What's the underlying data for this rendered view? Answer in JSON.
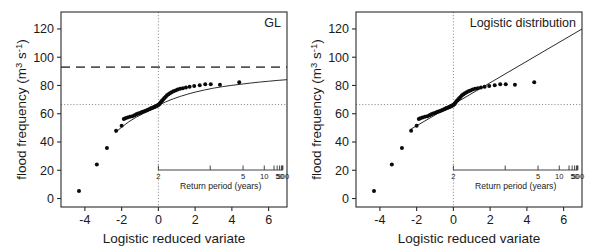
{
  "figure": {
    "axis_titles": {
      "x": "Logistic reduced variate",
      "y_main": "flood frequency (m",
      "y_sup1": "3",
      "y_mid": " s",
      "y_sup2": "-1",
      "y_close": ")",
      "y_full": "flood frequency (m3 s-1)",
      "inset_x": "Return period (years)"
    },
    "panels": [
      {
        "id": "left",
        "title": "GL"
      },
      {
        "id": "right",
        "title": "Logistic distribution"
      }
    ]
  },
  "chart_data": [
    {
      "type": "scatter",
      "title": "GL",
      "xlabel": "Logistic reduced variate",
      "ylabel": "flood frequency (m3 s-1)",
      "xlim": [
        -5.3,
        7.0
      ],
      "ylim": [
        -6,
        132
      ],
      "xticks": [
        -4,
        -2,
        0,
        2,
        4,
        6
      ],
      "xtick_labels": [
        "-4",
        "-2",
        "0",
        "2",
        "4",
        "6"
      ],
      "yticks": [
        0,
        20,
        40,
        60,
        80,
        100,
        120
      ],
      "ytick_labels": [
        "0",
        "20",
        "40",
        "60",
        "80",
        "100",
        "120"
      ],
      "grid": false,
      "legend": "none",
      "reference_lines": [
        {
          "name": "design-flood-dashed",
          "orientation": "horizontal",
          "y": 93,
          "style": "dashed"
        },
        {
          "name": "median-dotted",
          "orientation": "horizontal",
          "y": 66.5,
          "style": "dotted"
        },
        {
          "name": "zero-variate-dotted",
          "orientation": "vertical",
          "x": 0,
          "style": "dotted"
        }
      ],
      "inset_axis": {
        "name": "return-period-axis",
        "label": "Return period (years)",
        "labeled_ticks": [
          {
            "value": 2,
            "label": "2"
          },
          {
            "value": 5,
            "label": "5"
          },
          {
            "value": 10,
            "label": "10"
          },
          {
            "value": 50,
            "label": "50"
          },
          {
            "value": 500,
            "label": "500"
          }
        ],
        "unlabeled_ticks": [
          3,
          20,
          30,
          100,
          200
        ]
      },
      "points": [
        [
          -4.32,
          5.3
        ],
        [
          -3.35,
          24.0
        ],
        [
          -2.8,
          35.8
        ],
        [
          -2.3,
          47.9
        ],
        [
          -2.0,
          51.5
        ],
        [
          -1.88,
          56.2
        ],
        [
          -1.8,
          56.8
        ],
        [
          -1.68,
          57.4
        ],
        [
          -1.55,
          57.8
        ],
        [
          -1.42,
          58.3
        ],
        [
          -1.3,
          58.9
        ],
        [
          -1.2,
          59.6
        ],
        [
          -1.1,
          60.2
        ],
        [
          -1.0,
          60.6
        ],
        [
          -0.92,
          61.0
        ],
        [
          -0.84,
          61.4
        ],
        [
          -0.76,
          61.8
        ],
        [
          -0.68,
          62.2
        ],
        [
          -0.6,
          62.6
        ],
        [
          -0.53,
          63.0
        ],
        [
          -0.46,
          63.4
        ],
        [
          -0.4,
          63.8
        ],
        [
          -0.34,
          64.1
        ],
        [
          -0.28,
          64.4
        ],
        [
          -0.23,
          64.7
        ],
        [
          -0.18,
          65.0
        ],
        [
          -0.13,
          65.3
        ],
        [
          -0.09,
          65.6
        ],
        [
          -0.05,
          65.9
        ],
        [
          -0.01,
          66.2
        ],
        [
          0.03,
          66.6
        ],
        [
          0.07,
          67.1
        ],
        [
          0.11,
          67.8
        ],
        [
          0.16,
          68.6
        ],
        [
          0.21,
          69.4
        ],
        [
          0.27,
          70.3
        ],
        [
          0.33,
          71.2
        ],
        [
          0.4,
          72.1
        ],
        [
          0.47,
          73.0
        ],
        [
          0.55,
          73.8
        ],
        [
          0.63,
          74.5
        ],
        [
          0.72,
          75.2
        ],
        [
          0.82,
          75.9
        ],
        [
          0.93,
          76.5
        ],
        [
          1.05,
          77.1
        ],
        [
          1.18,
          77.6
        ],
        [
          1.33,
          78.1
        ],
        [
          1.5,
          78.6
        ],
        [
          1.7,
          79.1
        ],
        [
          1.95,
          79.6
        ],
        [
          2.25,
          80.2
        ],
        [
          2.55,
          80.8
        ],
        [
          2.85,
          80.9
        ],
        [
          3.35,
          80.6
        ],
        [
          4.4,
          82.2
        ]
      ],
      "fitted_curve": {
        "name": "gl-fit",
        "description": "Generalised logistic fitted curve, concave",
        "x": [
          -2.35,
          -2.0,
          -1.6,
          -1.2,
          -0.8,
          -0.4,
          0.0,
          0.4,
          0.8,
          1.2,
          1.6,
          2.0,
          2.5,
          3.0,
          3.5,
          4.0,
          4.5,
          5.0,
          5.5,
          6.0,
          6.5,
          7.0
        ],
        "y": [
          46.5,
          50.5,
          54.4,
          57.6,
          60.3,
          63.3,
          66.0,
          68.4,
          70.5,
          72.3,
          73.9,
          75.3,
          76.8,
          78.1,
          79.2,
          80.1,
          80.9,
          81.7,
          82.4,
          83.0,
          83.6,
          84.1
        ]
      }
    },
    {
      "type": "scatter",
      "title": "Logistic distribution",
      "xlabel": "Logistic reduced variate",
      "ylabel": "flood frequency (m3 s-1)",
      "xlim": [
        -5.3,
        7.0
      ],
      "ylim": [
        -6,
        132
      ],
      "xticks": [
        -4,
        -2,
        0,
        2,
        4,
        6
      ],
      "xtick_labels": [
        "-4",
        "-2",
        "0",
        "2",
        "4",
        "6"
      ],
      "yticks": [
        0,
        20,
        40,
        60,
        80,
        100,
        120
      ],
      "ytick_labels": [
        "0",
        "20",
        "40",
        "60",
        "80",
        "100",
        "120"
      ],
      "grid": false,
      "legend": "none",
      "reference_lines": [
        {
          "name": "median-dotted",
          "orientation": "horizontal",
          "y": 66.5,
          "style": "dotted"
        },
        {
          "name": "zero-variate-dotted",
          "orientation": "vertical",
          "x": 0,
          "style": "dotted"
        }
      ],
      "inset_axis": {
        "name": "return-period-axis",
        "label": "Return period (years)",
        "labeled_ticks": [
          {
            "value": 2,
            "label": "2"
          },
          {
            "value": 5,
            "label": "5"
          },
          {
            "value": 10,
            "label": "10"
          },
          {
            "value": 50,
            "label": "50"
          },
          {
            "value": 500,
            "label": "500"
          }
        ],
        "unlabeled_ticks": [
          3,
          20,
          30,
          100,
          200
        ]
      },
      "points": [
        [
          -4.32,
          5.3
        ],
        [
          -3.35,
          24.0
        ],
        [
          -2.8,
          35.8
        ],
        [
          -2.3,
          47.9
        ],
        [
          -2.0,
          51.5
        ],
        [
          -1.88,
          56.2
        ],
        [
          -1.8,
          56.8
        ],
        [
          -1.68,
          57.4
        ],
        [
          -1.55,
          57.8
        ],
        [
          -1.42,
          58.3
        ],
        [
          -1.3,
          58.9
        ],
        [
          -1.2,
          59.6
        ],
        [
          -1.1,
          60.2
        ],
        [
          -1.0,
          60.6
        ],
        [
          -0.92,
          61.0
        ],
        [
          -0.84,
          61.4
        ],
        [
          -0.76,
          61.8
        ],
        [
          -0.68,
          62.2
        ],
        [
          -0.6,
          62.6
        ],
        [
          -0.53,
          63.0
        ],
        [
          -0.46,
          63.4
        ],
        [
          -0.4,
          63.8
        ],
        [
          -0.34,
          64.1
        ],
        [
          -0.28,
          64.4
        ],
        [
          -0.23,
          64.7
        ],
        [
          -0.18,
          65.0
        ],
        [
          -0.13,
          65.3
        ],
        [
          -0.09,
          65.6
        ],
        [
          -0.05,
          65.9
        ],
        [
          -0.01,
          66.2
        ],
        [
          0.03,
          66.6
        ],
        [
          0.07,
          67.1
        ],
        [
          0.11,
          67.8
        ],
        [
          0.16,
          68.6
        ],
        [
          0.21,
          69.4
        ],
        [
          0.27,
          70.3
        ],
        [
          0.33,
          71.2
        ],
        [
          0.4,
          72.1
        ],
        [
          0.47,
          73.0
        ],
        [
          0.55,
          73.8
        ],
        [
          0.63,
          74.5
        ],
        [
          0.72,
          75.2
        ],
        [
          0.82,
          75.9
        ],
        [
          0.93,
          76.5
        ],
        [
          1.05,
          77.1
        ],
        [
          1.18,
          77.6
        ],
        [
          1.33,
          78.1
        ],
        [
          1.5,
          78.6
        ],
        [
          1.7,
          79.1
        ],
        [
          1.95,
          79.6
        ],
        [
          2.25,
          80.2
        ],
        [
          2.55,
          80.8
        ],
        [
          2.85,
          80.9
        ],
        [
          3.35,
          80.6
        ],
        [
          4.4,
          82.2
        ]
      ],
      "fitted_curve": {
        "name": "logistic-fit",
        "description": "Logistic fitted straight line",
        "x": [
          -2.35,
          7.0
        ],
        "y": [
          48.8,
          120.0
        ]
      }
    }
  ]
}
